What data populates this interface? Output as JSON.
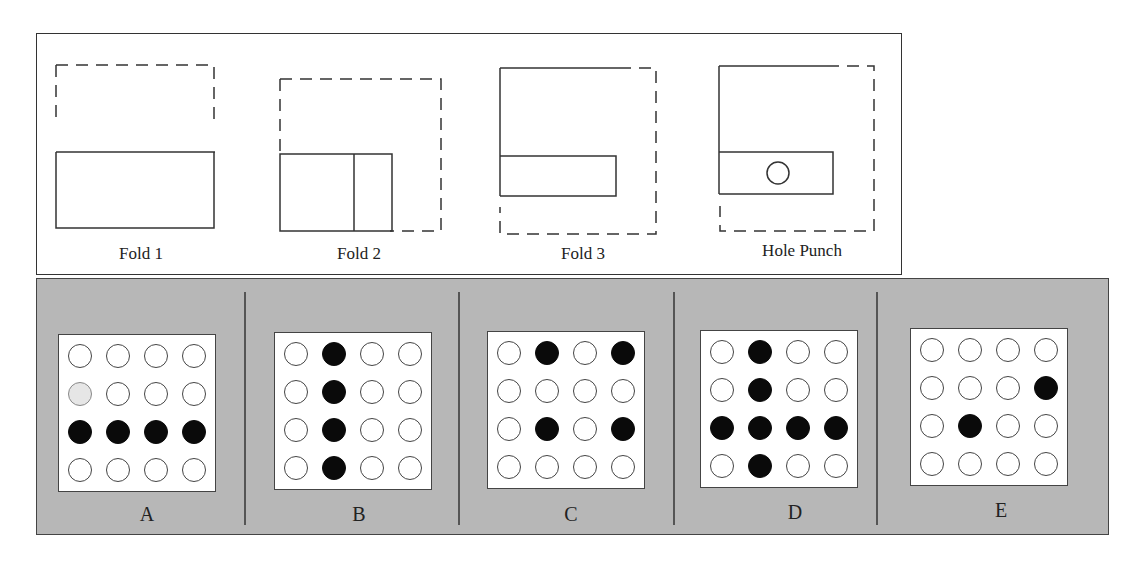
{
  "steps": [
    {
      "id": "fold1",
      "label": "Fold 1"
    },
    {
      "id": "fold2",
      "label": "Fold 2"
    },
    {
      "id": "fold3",
      "label": "Fold 3"
    },
    {
      "id": "punch",
      "label": "Hole Punch"
    }
  ],
  "options": [
    {
      "label": "A",
      "grid": [
        [
          0,
          0,
          0,
          0
        ],
        [
          2,
          0,
          0,
          0
        ],
        [
          1,
          1,
          1,
          1
        ],
        [
          0,
          0,
          0,
          0
        ]
      ]
    },
    {
      "label": "B",
      "grid": [
        [
          0,
          1,
          0,
          0
        ],
        [
          0,
          1,
          0,
          0
        ],
        [
          0,
          1,
          0,
          0
        ],
        [
          0,
          1,
          0,
          0
        ]
      ]
    },
    {
      "label": "C",
      "grid": [
        [
          0,
          1,
          0,
          1
        ],
        [
          0,
          0,
          0,
          0
        ],
        [
          0,
          1,
          0,
          1
        ],
        [
          0,
          0,
          0,
          0
        ]
      ]
    },
    {
      "label": "D",
      "grid": [
        [
          0,
          1,
          0,
          0
        ],
        [
          0,
          1,
          0,
          0
        ],
        [
          1,
          1,
          1,
          1
        ],
        [
          0,
          1,
          0,
          0
        ]
      ]
    },
    {
      "label": "E",
      "grid": [
        [
          0,
          0,
          0,
          0
        ],
        [
          0,
          0,
          0,
          1
        ],
        [
          0,
          1,
          0,
          0
        ],
        [
          0,
          0,
          0,
          0
        ]
      ]
    }
  ],
  "legend": {
    "0": "empty hole",
    "1": "punched hole (filled)",
    "2": "faded hole"
  }
}
